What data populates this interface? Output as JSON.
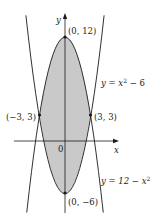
{
  "diagram": {
    "type": "region-between-curves",
    "axes": {
      "x_label": "x",
      "y_label": "y",
      "origin_label": "0"
    },
    "curves": [
      {
        "id": "upper",
        "equation": "y = 12 − x²",
        "label_prefix": "y = 12 − x",
        "label_sup": "2"
      },
      {
        "id": "lower",
        "equation": "y = x² − 6",
        "label_prefix": "y = x",
        "label_sup": "2",
        "label_suffix": " − 6"
      }
    ],
    "points": [
      {
        "label": "(0, 12)",
        "x": 0,
        "y": 12
      },
      {
        "label": "(−3, 3)",
        "x": -3,
        "y": 3
      },
      {
        "label": "(3, 3)",
        "x": 3,
        "y": 3
      },
      {
        "label": "(0, −6)",
        "x": 0,
        "y": -6
      }
    ],
    "shaded_region": "between y = 12 − x² and y = x² − 6 for −3 ≤ x ≤ 3",
    "colors": {
      "fill": "#c9c9c9",
      "stroke": "#1a1a1a",
      "text": "#222222"
    }
  }
}
